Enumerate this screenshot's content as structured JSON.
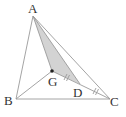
{
  "diagram": {
    "type": "geometry-triangle",
    "points": {
      "A": {
        "label": "A",
        "x": 33,
        "y": 16
      },
      "B": {
        "label": "B",
        "x": 16,
        "y": 99
      },
      "C": {
        "label": "C",
        "x": 110,
        "y": 99
      },
      "G": {
        "label": "G",
        "x": 52,
        "y": 71
      },
      "D": {
        "label": "D",
        "x": 80,
        "y": 84
      }
    },
    "segments": [
      "AB",
      "BC",
      "CA",
      "AG",
      "AD",
      "BG",
      "GD",
      "DC"
    ],
    "shaded_region": [
      "A",
      "G",
      "D"
    ],
    "equal_marks": [
      "GD",
      "DC"
    ],
    "colors": {
      "line": "#999999",
      "shade": "#d3d3d3",
      "point": "#222222"
    }
  }
}
